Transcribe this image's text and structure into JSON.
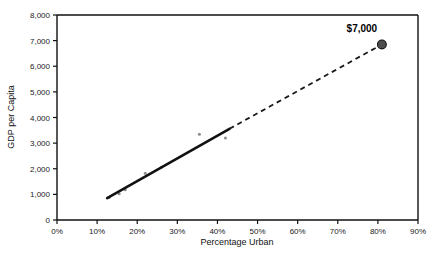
{
  "chart_data": {
    "type": "scatter",
    "title": "",
    "xlabel": "Percentage Urban",
    "ylabel": "GDP per Capita",
    "xlim": [
      0,
      90
    ],
    "ylim": [
      0,
      8000
    ],
    "grid": false,
    "legend": null,
    "x_tick_labels": [
      "0%",
      "10%",
      "20%",
      "30%",
      "40%",
      "50%",
      "60%",
      "70%",
      "80%",
      "90%"
    ],
    "x_tick_values": [
      0,
      10,
      20,
      30,
      40,
      50,
      60,
      70,
      80,
      90
    ],
    "y_tick_labels": [
      "0",
      "1,000",
      "2,000",
      "3,000",
      "4,000",
      "5,000",
      "6,000",
      "7,000",
      "8,000"
    ],
    "y_tick_values": [
      0,
      1000,
      2000,
      3000,
      4000,
      5000,
      6000,
      7000,
      8000
    ],
    "series": [
      {
        "name": "observed-countries",
        "type": "scatter",
        "marker": "small-gray-dot",
        "color": "#8c8c8c",
        "points": [
          {
            "x": 13.0,
            "y": 880
          },
          {
            "x": 15.5,
            "y": 1020
          },
          {
            "x": 17.0,
            "y": 1180
          },
          {
            "x": 22.0,
            "y": 1820
          },
          {
            "x": 26.0,
            "y": 2060
          },
          {
            "x": 35.5,
            "y": 3350
          },
          {
            "x": 42.0,
            "y": 3200
          }
        ]
      },
      {
        "name": "fitted-trend-solid",
        "type": "line",
        "style": "solid",
        "color": "#111111",
        "points": [
          {
            "x": 12.5,
            "y": 850
          },
          {
            "x": 43.0,
            "y": 3560
          }
        ]
      },
      {
        "name": "extrapolated-trend-dashed",
        "type": "line",
        "style": "dashed",
        "color": "#1a1a1a",
        "points": [
          {
            "x": 43.0,
            "y": 3560
          },
          {
            "x": 81.0,
            "y": 6850
          }
        ]
      },
      {
        "name": "projected-endpoint",
        "type": "scatter",
        "marker": "large-filled-circle",
        "color": "#4d4d4d",
        "points": [
          {
            "x": 81.0,
            "y": 6850
          }
        ]
      }
    ],
    "annotations": [
      {
        "name": "endpoint-value-label",
        "text": "$7,000",
        "x": 81.0,
        "y": 6850
      }
    ]
  }
}
